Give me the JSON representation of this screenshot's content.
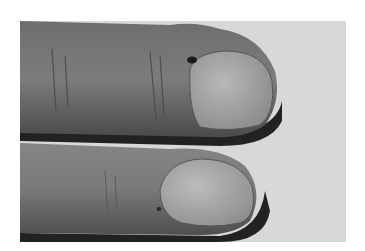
{
  "image": {
    "subject": "Two fingertips with fingernails, grayscale clinical photograph",
    "colors": {
      "background_page": "#ffffff",
      "backdrop": "#d6d6d6",
      "skin_dark": "#5a5a5a",
      "skin_mid": "#7a7a7a",
      "nail": "#a8a8a8",
      "shadow": "#1e1e1e"
    }
  }
}
